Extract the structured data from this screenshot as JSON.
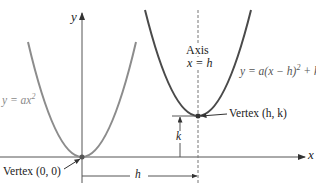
{
  "diagram": {
    "colors": {
      "background": "#ffffff",
      "axes": "#333333",
      "parabola_left": "#8c8c8c",
      "parabola_right": "#4a4a4a",
      "text": "#222222",
      "label_gray": "#8a8a8a"
    },
    "axes": {
      "x_label": "x",
      "y_label": "y"
    },
    "left_parabola": {
      "equation_prefix": "y = ax",
      "equation_exponent": "2",
      "vertex_label": "Vertex (0, 0)"
    },
    "right_parabola": {
      "equation_main": "y = a(x − h)",
      "equation_exponent": "2",
      "equation_suffix": " + k",
      "vertex_label": "Vertex (h, k)"
    },
    "axis_of_symmetry": {
      "line1": "Axis",
      "line2": "x = h"
    },
    "dimensions": {
      "horizontal_shift": "h",
      "vertical_shift": "k"
    }
  }
}
